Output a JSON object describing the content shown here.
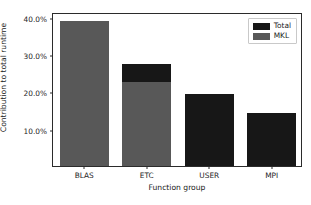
{
  "chart_data": {
    "type": "bar",
    "title": "",
    "xlabel": "Function group",
    "ylabel": "Contribution to total runtime",
    "categories": [
      "BLAS",
      "ETC",
      "USER",
      "MPI"
    ],
    "series": [
      {
        "name": "Total",
        "color": "#171717",
        "values": [
          38.8,
          27.3,
          19.2,
          14.2
        ]
      },
      {
        "name": "MKL",
        "color": "#585858",
        "values": [
          38.8,
          22.5,
          0.0,
          0.0
        ]
      }
    ],
    "ylim": [
      0,
      41.3
    ],
    "yticks": [
      10.0,
      20.0,
      30.0,
      40.0
    ],
    "ytick_labels": [
      "10.0%",
      "20.0%",
      "30.0%",
      "40.0%"
    ],
    "grid": false,
    "legend_position": "upper right",
    "legend_entries": [
      {
        "label": "Total",
        "color": "#171717"
      },
      {
        "label": "MKL",
        "color": "#585858"
      }
    ]
  },
  "axes": {
    "frame_color": "#2b2b2b",
    "background": "#ffffff"
  }
}
